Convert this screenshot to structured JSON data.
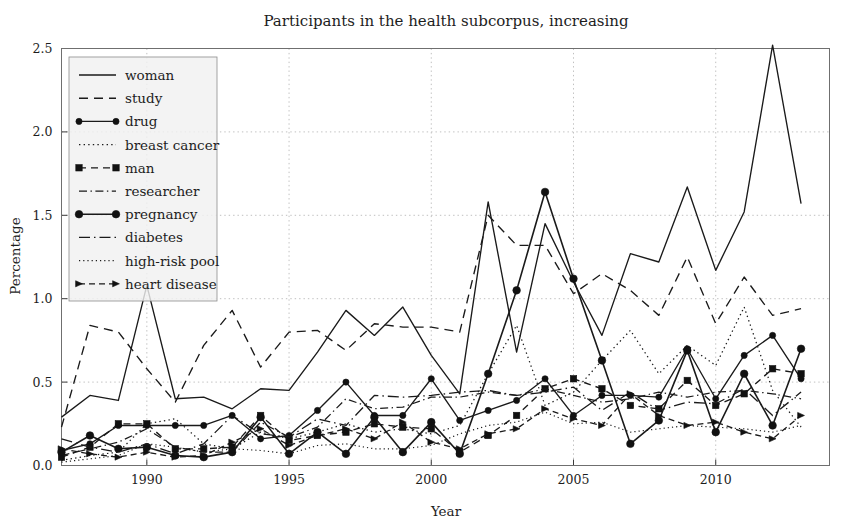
{
  "figure": {
    "title": "Participants in the health subcorpus, increasing",
    "xlabel": "Year",
    "ylabel": "Percentage"
  },
  "axes": {
    "y_ticks": [
      "0.0",
      "0.5",
      "1.0",
      "1.5",
      "2.0",
      "2.5"
    ],
    "x_ticks": [
      "1990",
      "1995",
      "2000",
      "2005",
      "2010"
    ]
  },
  "legend": {
    "items": [
      {
        "label": "woman",
        "style": "solid"
      },
      {
        "label": "study",
        "style": "dashed"
      },
      {
        "label": "drug",
        "style": "solid-circle"
      },
      {
        "label": "breast cancer",
        "style": "dotted"
      },
      {
        "label": "man",
        "style": "dashed-square"
      },
      {
        "label": "researcher",
        "style": "dashdot"
      },
      {
        "label": "pregnancy",
        "style": "solid-circle-big"
      },
      {
        "label": "diabetes",
        "style": "dashdot-long"
      },
      {
        "label": "high-risk pool",
        "style": "dotted-fine"
      },
      {
        "label": "heart disease",
        "style": "dashed-arrow"
      }
    ]
  },
  "chart_data": {
    "type": "line",
    "title": "Participants in the health subcorpus, increasing",
    "xlabel": "Year",
    "ylabel": "Percentage",
    "xlim": [
      1987,
      2014
    ],
    "ylim": [
      0.0,
      2.5
    ],
    "grid": true,
    "legend_position": "upper-left",
    "x": [
      1987,
      1988,
      1989,
      1990,
      1991,
      1992,
      1993,
      1994,
      1995,
      1996,
      1997,
      1998,
      1999,
      2000,
      2001,
      2002,
      2003,
      2004,
      2005,
      2006,
      2007,
      2008,
      2009,
      2010,
      2011,
      2012,
      2013
    ],
    "series": [
      {
        "name": "woman",
        "style": "solid",
        "values": [
          0.29,
          0.42,
          0.39,
          1.08,
          0.4,
          0.41,
          0.34,
          0.46,
          0.45,
          0.68,
          0.93,
          0.78,
          0.95,
          0.66,
          0.43,
          1.58,
          0.68,
          1.45,
          1.1,
          0.78,
          1.27,
          1.22,
          1.67,
          1.17,
          1.52,
          2.52,
          1.57
        ]
      },
      {
        "name": "study",
        "style": "dashed",
        "values": [
          0.23,
          0.84,
          0.8,
          0.58,
          0.38,
          0.72,
          0.93,
          0.59,
          0.8,
          0.81,
          0.69,
          0.85,
          0.83,
          0.83,
          0.8,
          1.5,
          1.32,
          1.32,
          1.03,
          1.15,
          1.05,
          0.9,
          1.25,
          0.85,
          1.13,
          0.9,
          0.94
        ]
      },
      {
        "name": "drug",
        "style": "solid-circle",
        "values": [
          0.09,
          0.13,
          0.24,
          0.24,
          0.24,
          0.24,
          0.3,
          0.16,
          0.18,
          0.33,
          0.5,
          0.3,
          0.3,
          0.52,
          0.27,
          0.33,
          0.39,
          0.52,
          0.3,
          0.42,
          0.42,
          0.41,
          0.7,
          0.4,
          0.66,
          0.78,
          0.52
        ]
      },
      {
        "name": "breast cancer",
        "style": "dotted",
        "values": [
          0.03,
          0.06,
          0.08,
          0.25,
          0.28,
          0.13,
          0.1,
          0.2,
          0.16,
          0.2,
          0.25,
          0.2,
          0.22,
          0.19,
          0.24,
          0.55,
          0.84,
          0.36,
          0.44,
          0.63,
          0.81,
          0.55,
          0.72,
          0.6,
          0.95,
          0.45,
          0.23
        ]
      },
      {
        "name": "man",
        "style": "dashed-square",
        "values": [
          0.05,
          0.11,
          0.25,
          0.25,
          0.1,
          0.1,
          0.11,
          0.3,
          0.15,
          0.18,
          0.2,
          0.25,
          0.23,
          0.22,
          0.08,
          0.18,
          0.3,
          0.46,
          0.52,
          0.46,
          0.36,
          0.34,
          0.51,
          0.36,
          0.43,
          0.58,
          0.55
        ]
      },
      {
        "name": "researcher",
        "style": "dashdot",
        "values": [
          0.06,
          0.1,
          0.14,
          0.22,
          0.11,
          0.08,
          0.08,
          0.26,
          0.17,
          0.23,
          0.4,
          0.34,
          0.35,
          0.41,
          0.41,
          0.44,
          0.42,
          0.46,
          0.42,
          0.38,
          0.4,
          0.44,
          0.41,
          0.44,
          0.45,
          0.43,
          0.4
        ]
      },
      {
        "name": "pregnancy",
        "style": "solid-circle-big",
        "values": [
          0.08,
          0.18,
          0.1,
          0.11,
          0.06,
          0.05,
          0.08,
          0.29,
          0.07,
          0.2,
          0.07,
          0.29,
          0.08,
          0.26,
          0.07,
          0.55,
          1.05,
          1.64,
          1.12,
          0.63,
          0.13,
          0.27,
          0.69,
          0.2,
          0.55,
          0.24,
          0.7
        ]
      },
      {
        "name": "diabetes",
        "style": "dashdot-long",
        "values": [
          0.16,
          0.11,
          0.08,
          0.13,
          0.07,
          0.13,
          0.3,
          0.19,
          0.17,
          0.28,
          0.24,
          0.42,
          0.41,
          0.42,
          0.44,
          0.45,
          0.42,
          0.44,
          0.47,
          0.33,
          0.44,
          0.33,
          0.38,
          0.37,
          0.46,
          0.3,
          0.44
        ]
      },
      {
        "name": "high-risk pool",
        "style": "dotted-fine",
        "values": [
          0.02,
          0.04,
          0.06,
          0.13,
          0.11,
          0.08,
          0.1,
          0.09,
          0.07,
          0.12,
          0.13,
          0.1,
          0.1,
          0.12,
          0.19,
          0.24,
          0.26,
          0.32,
          0.25,
          0.26,
          0.2,
          0.22,
          0.24,
          0.23,
          0.22,
          0.2,
          0.24
        ]
      },
      {
        "name": "heart disease",
        "style": "dashed-arrow",
        "values": [
          0.1,
          0.07,
          0.05,
          0.08,
          0.05,
          0.06,
          0.14,
          0.22,
          0.12,
          0.18,
          0.22,
          0.16,
          0.26,
          0.14,
          0.1,
          0.19,
          0.22,
          0.34,
          0.28,
          0.24,
          0.43,
          0.3,
          0.24,
          0.26,
          0.2,
          0.16,
          0.3
        ]
      }
    ]
  }
}
